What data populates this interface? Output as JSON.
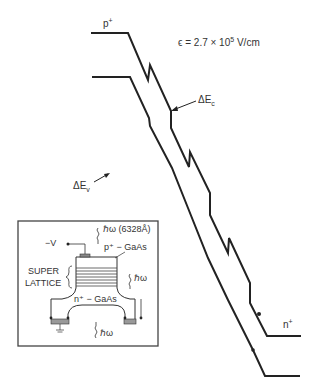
{
  "diagram": {
    "type": "band diagram with inset device schematic",
    "labels": {
      "p_plus": "p",
      "p_plus_sup": "+",
      "field": "ϵ = 2.7 × 10",
      "field_exp": "5",
      "field_unit": " V/cm",
      "delta_ec": "ΔE",
      "delta_ec_sub": "c",
      "delta_ev": "ΔE",
      "delta_ev_sub": "v",
      "n_plus": "n",
      "n_plus_sup": "+"
    },
    "conduction_band_points": [
      [
        91,
        33
      ],
      [
        128,
        33
      ],
      [
        148,
        80
      ],
      [
        150,
        65
      ],
      [
        171,
        111
      ],
      [
        171,
        128
      ],
      [
        189,
        167
      ],
      [
        190,
        152
      ],
      [
        210,
        193
      ],
      [
        210,
        215
      ],
      [
        228,
        253
      ],
      [
        229,
        238
      ],
      [
        250,
        283
      ],
      [
        250,
        303
      ],
      [
        267,
        336
      ],
      [
        301,
        336
      ]
    ],
    "valence_band_points": [
      [
        92,
        77
      ],
      [
        130,
        77
      ],
      [
        149,
        118
      ],
      [
        150,
        126
      ],
      [
        172,
        168
      ],
      [
        188,
        208
      ],
      [
        208,
        258
      ],
      [
        228,
        300
      ],
      [
        253,
        350
      ],
      [
        265,
        376
      ],
      [
        300,
        376
      ]
    ],
    "inset": {
      "laser_label": "ℏω (6328Å)",
      "voltage": "−V",
      "p_layer": "p⁺ − GaAs",
      "superlattice_line1": "SUPER",
      "superlattice_line2": "LATTICE",
      "emission": "ℏω",
      "n_layer": "n⁺ − GaAs",
      "bottom_emission": "ℏω"
    }
  }
}
